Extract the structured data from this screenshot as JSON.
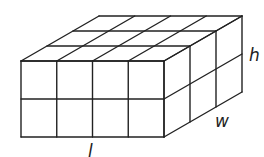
{
  "diagram": {
    "type": "rectangular-prism-unit-cubes",
    "dimensions": {
      "length_cubes": 4,
      "width_cubes": 3,
      "height_cubes": 2
    },
    "labels": {
      "length": "l",
      "width": "w",
      "height": "h"
    },
    "stroke_color": "#222222",
    "background_color": "#ffffff"
  }
}
